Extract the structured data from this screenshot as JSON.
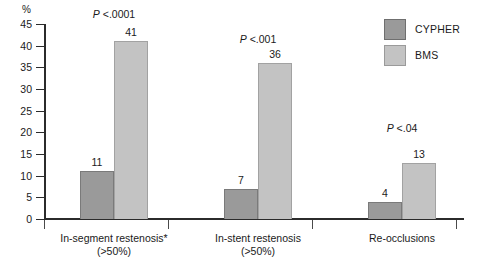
{
  "chart_data": {
    "type": "bar",
    "title": "",
    "subtitle": "",
    "xlabel": "",
    "ylabel": "%",
    "ylim": [
      0,
      45
    ],
    "yticks": [
      0,
      5,
      10,
      15,
      20,
      25,
      30,
      35,
      40,
      45
    ],
    "ytick_labels": [
      "0",
      "5",
      "10",
      "15",
      "20",
      "25",
      "30",
      "35",
      "40",
      "45"
    ],
    "grid": false,
    "legend_position": "top-right",
    "categories": [
      "In-segment restenosis* (>50%)",
      "In-stent restenosis (>50%)",
      "Re-occlusions"
    ],
    "category_lines": [
      [
        "In-segment restenosis*",
        "(>50%)"
      ],
      [
        "In-stent restenosis",
        "(>50%)"
      ],
      [
        "Re-occlusions",
        ""
      ]
    ],
    "series": [
      {
        "name": "CYPHER",
        "color": "#9a9a9a",
        "values": [
          11,
          7,
          4
        ]
      },
      {
        "name": "BMS",
        "color": "#c3c3c3",
        "values": [
          41,
          36,
          13
        ]
      }
    ],
    "annotations": [
      {
        "text": "P <.0001",
        "p_italic": "P",
        "p_rest": " <.0001",
        "category": "In-segment restenosis* (>50%)"
      },
      {
        "text": "P <.001",
        "p_italic": "P",
        "p_rest": " <.001",
        "category": "In-stent restenosis (>50%)"
      },
      {
        "text": "P <.04",
        "p_italic": "P",
        "p_rest": " <.04",
        "category": "Re-occlusions"
      }
    ]
  },
  "axis": {
    "unit_label": "%"
  },
  "legend": {
    "items": [
      {
        "label": "CYPHER",
        "color": "#9a9a9a"
      },
      {
        "label": "BMS",
        "color": "#c3c3c3"
      }
    ]
  }
}
